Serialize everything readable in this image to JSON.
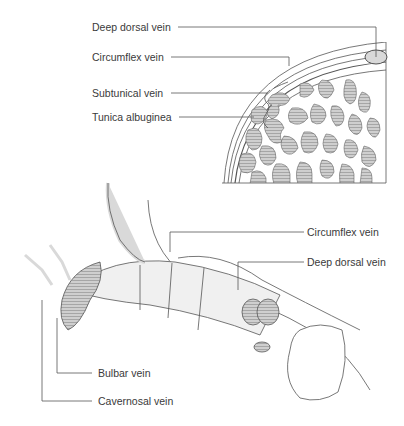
{
  "diagram": {
    "type": "anatomical-illustration",
    "colors": {
      "line": "#555555",
      "fill_light": "#d9d9d9",
      "fill_hatch": "#b5b5b5",
      "background": "#ffffff",
      "text": "#3a3a3a"
    },
    "cross_section": {
      "labels": [
        {
          "id": "deep-dorsal-vein",
          "text": "Deep dorsal vein"
        },
        {
          "id": "circumflex-vein",
          "text": "Circumflex vein"
        },
        {
          "id": "subtunical-vein",
          "text": "Subtunical vein"
        },
        {
          "id": "tunica-albuginea",
          "text": "Tunica albuginea"
        }
      ]
    },
    "longitudinal_view": {
      "labels": [
        {
          "id": "circumflex-vein",
          "text": "Circumflex vein"
        },
        {
          "id": "deep-dorsal-vein",
          "text": "Deep dorsal vein"
        },
        {
          "id": "bulbar-vein",
          "text": "Bulbar vein"
        },
        {
          "id": "cavernosal-vein",
          "text": "Cavernosal vein"
        }
      ]
    }
  }
}
